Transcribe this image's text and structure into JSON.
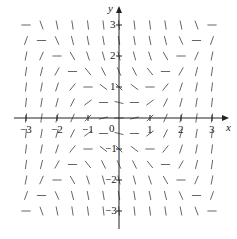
{
  "chart_data": {
    "type": "slope_field",
    "equation": "dy/dx = x^2 - y^2",
    "x_range": [
      -3,
      3
    ],
    "y_range": [
      -3,
      3
    ],
    "grid_step": 0.5,
    "x_ticks": [
      "−3",
      "−2",
      "−1",
      "0",
      "1",
      "2",
      "3"
    ],
    "y_ticks": [
      "3",
      "2",
      "1",
      "−1",
      "−2",
      "−3"
    ],
    "xlabel": "x",
    "ylabel": "y",
    "nullclines": [
      "y = x",
      "y = -x"
    ]
  },
  "labels": {
    "x_axis": "x",
    "y_axis": "y",
    "origin": "0"
  },
  "style": {
    "axis_color": "#222222",
    "segment_color": "#555555"
  }
}
